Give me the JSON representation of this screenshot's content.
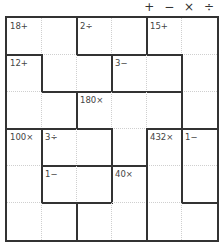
{
  "header": {
    "operators": "+ − × ÷"
  },
  "grid": {
    "size": 6,
    "cages": [
      {
        "label": "18+",
        "cells": [
          [
            0,
            0
          ],
          [
            0,
            1
          ],
          [
            1,
            1
          ],
          [
            1,
            2
          ]
        ]
      },
      {
        "label": "2÷",
        "cells": [
          [
            0,
            2
          ],
          [
            0,
            3
          ]
        ]
      },
      {
        "label": "15+",
        "cells": [
          [
            0,
            4
          ],
          [
            0,
            5
          ],
          [
            1,
            5
          ],
          [
            2,
            5
          ]
        ]
      },
      {
        "label": "12+",
        "cells": [
          [
            1,
            0
          ],
          [
            2,
            0
          ],
          [
            2,
            1
          ]
        ]
      },
      {
        "label": "3−",
        "cells": [
          [
            1,
            3
          ],
          [
            1,
            4
          ]
        ]
      },
      {
        "label": "180×",
        "cells": [
          [
            2,
            2
          ],
          [
            2,
            3
          ],
          [
            2,
            4
          ],
          [
            3,
            3
          ]
        ]
      },
      {
        "label": "100×",
        "cells": [
          [
            3,
            0
          ],
          [
            4,
            0
          ],
          [
            5,
            0
          ],
          [
            5,
            1
          ]
        ]
      },
      {
        "label": "3÷",
        "cells": [
          [
            3,
            1
          ],
          [
            3,
            2
          ]
        ]
      },
      {
        "label": "432×",
        "cells": [
          [
            3,
            4
          ],
          [
            4,
            4
          ],
          [
            5,
            4
          ],
          [
            5,
            5
          ]
        ]
      },
      {
        "label": "1−",
        "cells": [
          [
            3,
            5
          ],
          [
            4,
            5
          ]
        ]
      },
      {
        "label": "1−",
        "cells": [
          [
            4,
            1
          ],
          [
            4,
            2
          ]
        ]
      },
      {
        "label": "40×",
        "cells": [
          [
            4,
            3
          ],
          [
            5,
            2
          ],
          [
            5,
            3
          ]
        ]
      }
    ]
  }
}
